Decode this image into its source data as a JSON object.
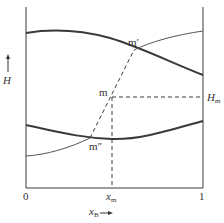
{
  "diagram": {
    "type": "enthalpy-composition diagram",
    "y_axis": {
      "label": "H",
      "arrow": "up"
    },
    "x_axis": {
      "label": "x",
      "label_sub": "B",
      "arrow": "right",
      "ticks": [
        "0",
        "1"
      ],
      "marked": {
        "label": "x",
        "label_sub": "m"
      }
    },
    "points": [
      {
        "id": "m_prime",
        "label": "m′"
      },
      {
        "id": "m",
        "label": "m"
      },
      {
        "id": "m_double_prime",
        "label": "m″"
      }
    ],
    "right_marker": {
      "label": "H",
      "label_sub": "m"
    },
    "curves": [
      {
        "name": "upper-thick-curve",
        "style": "thick"
      },
      {
        "name": "upper-thin-curve",
        "style": "thin"
      },
      {
        "name": "lower-thick-curve",
        "style": "thick"
      },
      {
        "name": "lower-thin-curve",
        "style": "thin"
      },
      {
        "name": "tie-line",
        "style": "dashed"
      }
    ],
    "colors": {
      "line": "#3a3a3a",
      "text": "#333333",
      "background": "#ffffff"
    }
  }
}
